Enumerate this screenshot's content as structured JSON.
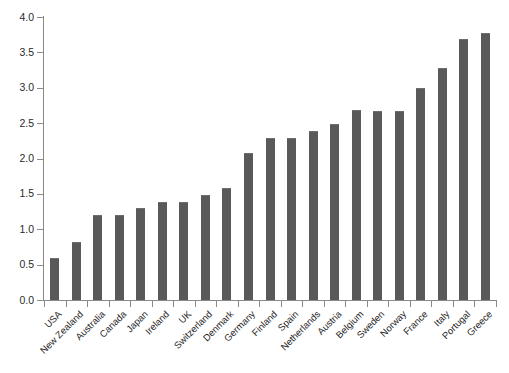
{
  "chart_data": {
    "type": "bar",
    "title": "",
    "subtitle": "",
    "xlabel": "",
    "ylabel": "",
    "ylim": [
      0.0,
      4.0
    ],
    "ytick_step": 0.5,
    "grid": false,
    "legend": "none",
    "bar_color": "#595959",
    "axis_color": "#8a8a8a",
    "categories": [
      "USA",
      "New Zealand",
      "Australia",
      "Canada",
      "Japan",
      "Ireland",
      "UK",
      "Switzerland",
      "Denmark",
      "Germany",
      "Finland",
      "Spain",
      "Netherlands",
      "Austria",
      "Belgium",
      "Sweden",
      "Norway",
      "France",
      "Italy",
      "Portugal",
      "Greece"
    ],
    "values": [
      0.6,
      0.82,
      1.2,
      1.2,
      1.3,
      1.39,
      1.39,
      1.49,
      1.58,
      2.08,
      2.29,
      2.29,
      2.39,
      2.49,
      2.68,
      2.67,
      2.67,
      3.0,
      3.28,
      3.69,
      3.78
    ],
    "ytick_labels": [
      "0.0",
      "0.5",
      "1.0",
      "1.5",
      "2.0",
      "2.5",
      "3.0",
      "3.5",
      "4.0"
    ],
    "ytick_values": [
      0.0,
      0.5,
      1.0,
      1.5,
      2.0,
      2.5,
      3.0,
      3.5,
      4.0
    ]
  }
}
